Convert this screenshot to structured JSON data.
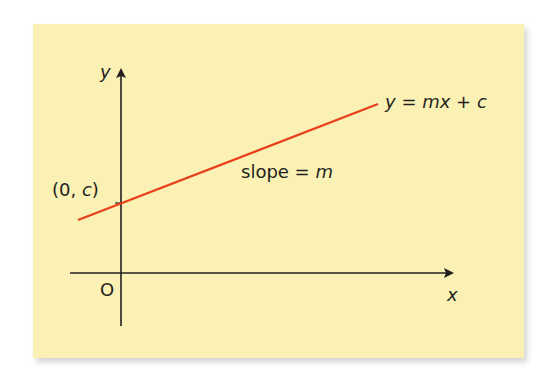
{
  "diagram": {
    "background_color": "#fbf1b4",
    "line_color": "#e8401c",
    "axis_color": "#231f20",
    "axes": {
      "x_label": "x",
      "y_label": "y",
      "origin_label": "O"
    },
    "line": {
      "equation": {
        "lhs": "y",
        "eq": " = ",
        "m": "m",
        "x": "x",
        "plus": " + ",
        "c": "c"
      }
    },
    "intercept_label": {
      "open": "(0, ",
      "c": "c",
      "close": ")"
    },
    "slope_label": {
      "text": "slope = ",
      "m": "m"
    }
  }
}
